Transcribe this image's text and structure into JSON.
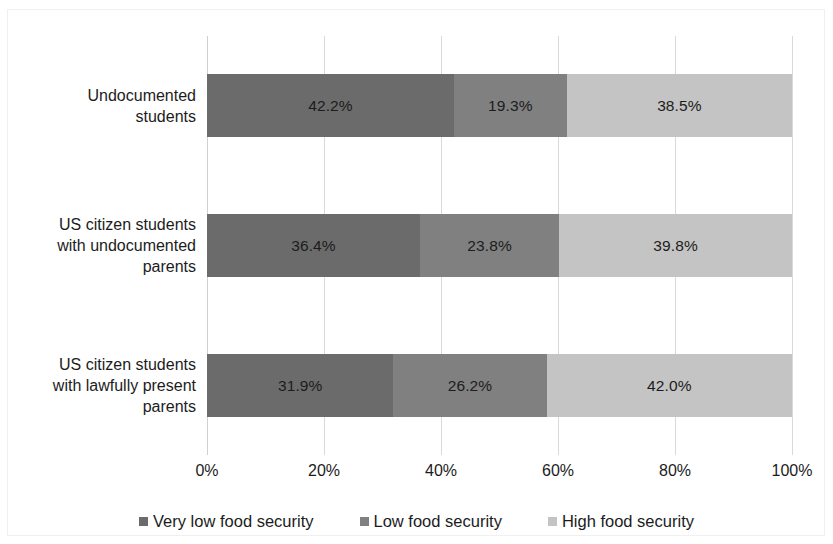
{
  "chart_data": {
    "type": "bar",
    "orientation": "horizontal",
    "stacked": true,
    "stack_mode": "percent",
    "title": "",
    "subtitle": "",
    "xlabel": "",
    "ylabel": "",
    "xlim": [
      0,
      100
    ],
    "grid": true,
    "legend_position": "bottom",
    "categories": [
      "Undocumented\nstudents",
      "US citizen students\nwith undocumented\nparents",
      "US citizen students\nwith lawfully present\nparents"
    ],
    "xticks": [
      "0%",
      "20%",
      "40%",
      "60%",
      "80%",
      "100%"
    ],
    "xtick_values": [
      0,
      20,
      40,
      60,
      80,
      100
    ],
    "series": [
      {
        "name": "Very low food security",
        "color": "#6b6b6b",
        "values": [
          42.2,
          36.4,
          31.9
        ],
        "labels": [
          "42.2%",
          "36.4%",
          "31.9%"
        ]
      },
      {
        "name": "Low food security",
        "color": "#808080",
        "values": [
          19.3,
          23.8,
          26.2
        ],
        "labels": [
          "19.3%",
          "23.8%",
          "26.2%"
        ]
      },
      {
        "name": "High food security",
        "color": "#c4c4c4",
        "values": [
          38.5,
          39.8,
          42.0
        ],
        "labels": [
          "38.5%",
          "39.8%",
          "42.0%"
        ]
      }
    ],
    "legend": [
      {
        "label": "Very low food security",
        "color": "#6b6b6b",
        "marker": "square"
      },
      {
        "label": "Low food security",
        "color": "#808080",
        "marker": "square"
      },
      {
        "label": "High food security",
        "color": "#c4c4c4",
        "marker": "square"
      }
    ],
    "colors": {
      "very_low": "#6b6b6b",
      "low": "#808080",
      "high": "#c4c4c4",
      "gridline": "#d9d9d9",
      "text": "#1c1c1c",
      "background": "#ffffff"
    }
  }
}
